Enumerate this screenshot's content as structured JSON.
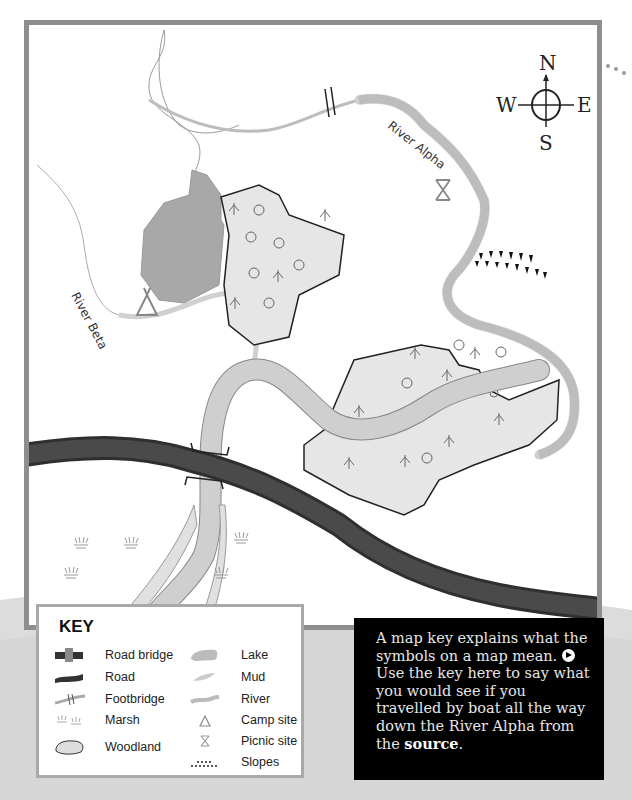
{
  "map": {
    "labels": {
      "river_alpha": "River Alpha",
      "river_beta": "River Beta"
    },
    "compass": {
      "north": "N",
      "south": "S",
      "east": "E",
      "west": "W"
    },
    "features": [
      {
        "type": "footbridge",
        "location": "top, over River Alpha"
      },
      {
        "type": "picnic-site",
        "location": "right of north woodland"
      },
      {
        "type": "slopes",
        "location": "right bank of River Alpha"
      },
      {
        "type": "lake",
        "location": "west of north woodland"
      },
      {
        "type": "woodland",
        "count": 2
      },
      {
        "type": "camp-site",
        "location": "near River Beta"
      },
      {
        "type": "road-bridge",
        "location": "where road crosses river"
      },
      {
        "type": "road",
        "location": "crossing map west to east"
      },
      {
        "type": "marsh",
        "count": 5
      },
      {
        "type": "mud",
        "location": "river banks near bottom"
      }
    ],
    "colors": {
      "frame": "#8e8e8e",
      "road": "#3c3c3c",
      "river": "#d0d0d0",
      "lake": "#a8a8a8",
      "woodland": "#e6e6e6"
    }
  },
  "key": {
    "title": "KEY",
    "left_items": [
      {
        "icon": "road-bridge-icon",
        "label": "Road bridge"
      },
      {
        "icon": "road-icon",
        "label": "Road"
      },
      {
        "icon": "footbridge-icon",
        "label": "Footbridge"
      },
      {
        "icon": "marsh-icon",
        "label": "Marsh"
      },
      {
        "icon": "woodland-icon",
        "label": "Woodland"
      }
    ],
    "right_items": [
      {
        "icon": "lake-icon",
        "label": "Lake"
      },
      {
        "icon": "mud-icon",
        "label": "Mud"
      },
      {
        "icon": "river-icon",
        "label": "River"
      },
      {
        "icon": "camp-site-icon",
        "label": "Camp site"
      },
      {
        "icon": "picnic-site-icon",
        "label": "Picnic site"
      },
      {
        "icon": "slopes-icon",
        "label": "Slopes"
      }
    ]
  },
  "info": {
    "text_1": "A map key explains what the symbols on a map mean.",
    "text_2": "Use the key here to say what you would see if you travelled by boat all the way down the River Alpha from the",
    "bold_word": "source",
    "end": "."
  }
}
